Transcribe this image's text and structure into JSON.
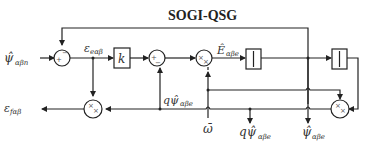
{
  "title": "SOGI-QSG",
  "blocks": {
    "gain": "k",
    "sum1": {
      "signs": [
        "+",
        "−"
      ]
    },
    "sum2": {
      "signs": [
        "+",
        "−"
      ]
    },
    "mult1": {
      "signs": [
        "×",
        "×"
      ]
    },
    "mult2": {
      "signs": [
        "×",
        "×"
      ]
    },
    "mult3": {
      "signs": [
        "×",
        "×"
      ]
    },
    "integrator1": "∫",
    "integrator2": "∫"
  },
  "signals": {
    "input": {
      "main": "ψ̂",
      "sub": "αβn"
    },
    "error_e": {
      "main": "ε",
      "sub": "eαβ"
    },
    "E_hat": {
      "main": "Ê",
      "sub": "αβe"
    },
    "q_psi_mid": {
      "main": "qψ̂",
      "sub": "αβe"
    },
    "error_f": {
      "main": "ε",
      "sub": "fαβ"
    },
    "omega": {
      "main": "ω̄",
      "sub": ""
    },
    "q_psi_out": {
      "main": "qψ̂",
      "sub": "αβe"
    },
    "psi_out": {
      "main": "ψ̂",
      "sub": "αβe"
    }
  }
}
